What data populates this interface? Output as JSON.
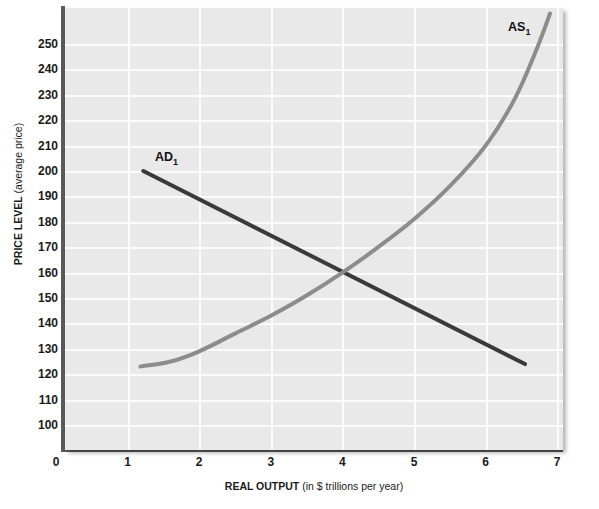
{
  "chart_data": {
    "type": "line",
    "title": "",
    "xlabel_bold": "REAL OUTPUT",
    "xlabel_rest": " (in $ trillions per year)",
    "ylabel_bold": "PRICE LEVEL",
    "ylabel_rest": " (average price)",
    "xlim": [
      0,
      7
    ],
    "ylim": [
      95,
      258
    ],
    "grid": true,
    "legend": "inline-curve-labels",
    "xticks": [
      "0",
      "1",
      "2",
      "3",
      "4",
      "5",
      "6",
      "7"
    ],
    "xtick_values": [
      0,
      1,
      2,
      3,
      4,
      5,
      6,
      7
    ],
    "yticks": [
      "100",
      "110",
      "120",
      "130",
      "140",
      "150",
      "160",
      "170",
      "180",
      "190",
      "200",
      "210",
      "220",
      "230",
      "240",
      "250"
    ],
    "ytick_values": [
      100,
      110,
      120,
      130,
      140,
      150,
      160,
      170,
      180,
      190,
      200,
      210,
      220,
      230,
      240,
      250
    ],
    "equilibrium": {
      "x": 4.0,
      "y": 160
    },
    "series": [
      {
        "name": "AD1",
        "label_text": "AD",
        "label_sub": "1",
        "color": "#3a3a3a",
        "style": "straight-line",
        "x": [
          1.22,
          6.55
        ],
        "values": [
          200,
          124
        ]
      },
      {
        "name": "AS1",
        "label_text": "AS",
        "label_sub": "1",
        "color": "#8c8c8c",
        "style": "upward-sloping-curve",
        "x": [
          1.18,
          1.6,
          2.0,
          2.5,
          3.0,
          3.5,
          4.0,
          4.5,
          5.0,
          5.5,
          6.0,
          6.4,
          6.7,
          6.9
        ],
        "values": [
          123,
          125,
          129,
          136,
          143,
          151,
          160,
          170,
          181,
          194,
          210,
          228,
          247,
          262
        ]
      }
    ],
    "colors": {
      "plot_background": "#e9e9e9",
      "gridline": "#fbfbfb",
      "axis": "#5a5a5a",
      "ad_curve": "#3a3a3a",
      "as_curve": "#8c8c8c",
      "text": "#1a1a1a"
    }
  }
}
